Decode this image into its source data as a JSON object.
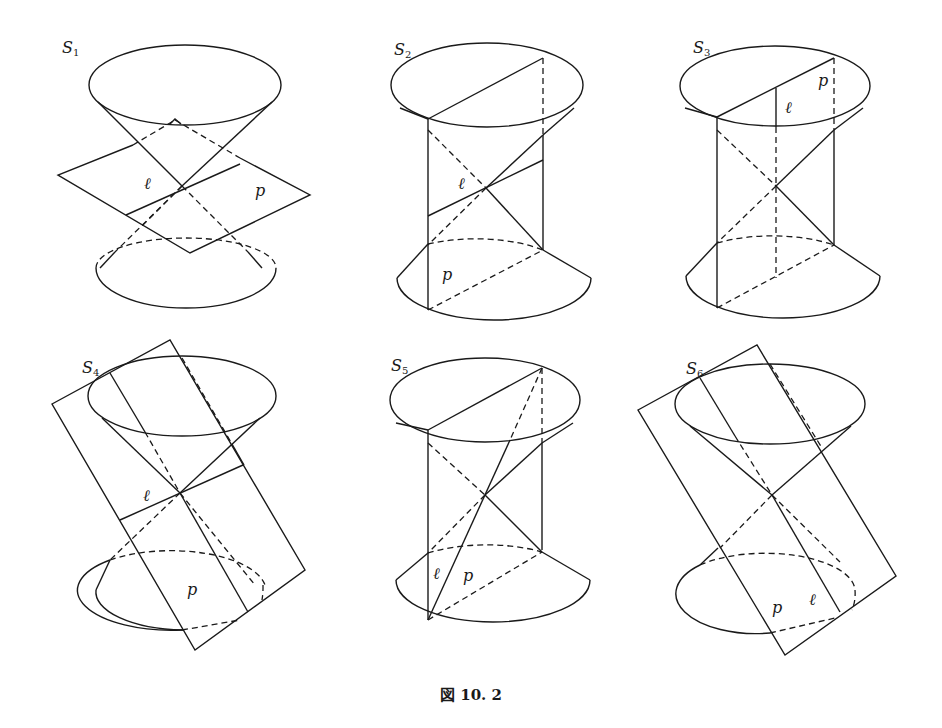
{
  "figure": {
    "caption": "図 10. 2",
    "panels": [
      {
        "id": "S1",
        "name": "S",
        "sub": "1",
        "line_label": "ℓ",
        "plane_label": "p",
        "description": "plane cuts double cone through apex, transverse to axis"
      },
      {
        "id": "S2",
        "name": "S",
        "sub": "2",
        "line_label": "ℓ",
        "plane_label": "p",
        "description": "plane through apex, parallel-ish to axis"
      },
      {
        "id": "S3",
        "name": "S",
        "sub": "3",
        "line_label": "ℓ",
        "plane_label": "p",
        "description": "plane contains axis"
      },
      {
        "id": "S4",
        "name": "S",
        "sub": "4",
        "line_label": "ℓ",
        "plane_label": "p",
        "description": "tilted plane through apex"
      },
      {
        "id": "S5",
        "name": "S",
        "sub": "5",
        "line_label": "ℓ",
        "plane_label": "p",
        "description": "plane through apex containing generator"
      },
      {
        "id": "S6",
        "name": "S",
        "sub": "6",
        "line_label": "ℓ",
        "plane_label": "p",
        "description": "tilted plane tangent along generator"
      }
    ]
  }
}
